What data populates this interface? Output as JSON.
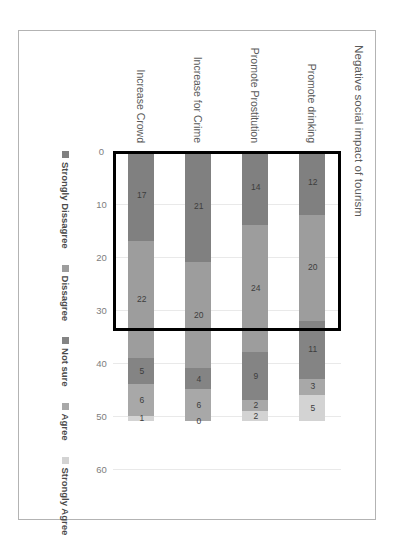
{
  "chart_data": {
    "type": "bar",
    "subtype": "stacked-bar-horizontal",
    "title": "Negative social impact of tourism",
    "xlabel": "",
    "ylabel": "",
    "categories": [
      "Promote drinking",
      "Promote Prostitution",
      "Increase for Crime",
      "Increase Crowd"
    ],
    "series": [
      {
        "name": "Strongly Dissagree",
        "color": "#808080",
        "values": [
          12,
          14,
          21,
          17
        ]
      },
      {
        "name": "Dissagree",
        "color": "#9d9d9d",
        "values": [
          20,
          24,
          20,
          22
        ]
      },
      {
        "name": "Not sure",
        "color": "#848484",
        "values": [
          11,
          9,
          4,
          5
        ]
      },
      {
        "name": "Agree",
        "color": "#a8a8a8",
        "values": [
          3,
          2,
          6,
          6
        ]
      },
      {
        "name": "Strongly Agree",
        "color": "#d3d3d3",
        "values": [
          5,
          2,
          0,
          1
        ]
      }
    ],
    "axis_ticks": [
      0,
      10,
      20,
      30,
      40,
      50,
      60
    ],
    "axis_min": 0,
    "axis_max": 60,
    "grid": true,
    "legend_position": "bottom",
    "annotations": [
      {
        "kind": "highlight-rectangle",
        "color": "#000000",
        "value_start": 0,
        "value_end": 34,
        "note": "Black rectangle outlining the Strongly Dissagree and Dissagree segments across all four categories"
      }
    ],
    "totals": [
      51,
      51,
      51,
      51
    ]
  },
  "legend": {
    "items": [
      {
        "label": "Strongly Dissagree",
        "color": "#808080"
      },
      {
        "label": "Dissagree",
        "color": "#9d9d9d"
      },
      {
        "label": "Not sure",
        "color": "#848484"
      },
      {
        "label": "Agree",
        "color": "#a8a8a8"
      },
      {
        "label": "Strongly Agree",
        "color": "#d3d3d3"
      }
    ]
  },
  "axis": {
    "ticks": [
      "0",
      "10",
      "20",
      "30",
      "40",
      "50",
      "60"
    ]
  },
  "labels": {
    "data_labels": [
      [
        "12",
        "20",
        "11",
        "3",
        "5"
      ],
      [
        "14",
        "24",
        "9",
        "2",
        "2"
      ],
      [
        "21",
        "20",
        "4",
        "6",
        "0"
      ],
      [
        "17",
        "22",
        "5",
        "6",
        "1"
      ]
    ]
  }
}
